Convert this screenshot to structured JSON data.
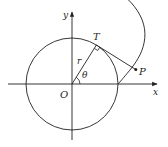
{
  "diagram": {
    "type": "geometry",
    "colors": {
      "stroke": "#231f20",
      "background": "#ffffff"
    },
    "labels": {
      "y_axis": "y",
      "x_axis": "x",
      "origin": "O",
      "tangent_point": "T",
      "point_p": "P",
      "radius": "r",
      "angle": "θ"
    },
    "geometry": {
      "origin_px": [
        72,
        84
      ],
      "radius_px": 46,
      "theta_deg": 58,
      "T_px": [
        96.4,
        45
      ],
      "P_px": [
        135.8,
        69.6
      ]
    }
  }
}
